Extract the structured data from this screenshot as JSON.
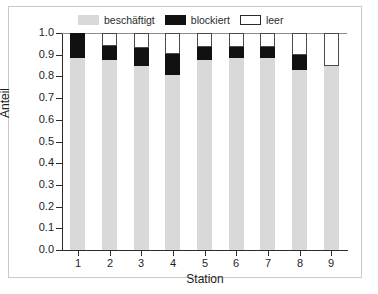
{
  "chart_data": {
    "type": "bar",
    "subtype": "stacked-vertical",
    "title": "",
    "xlabel": "Station",
    "ylabel": "Anteil",
    "categories": [
      "1",
      "2",
      "3",
      "4",
      "5",
      "6",
      "7",
      "8",
      "9"
    ],
    "xtick_labels": [
      "1",
      "2",
      "3",
      "4",
      "5",
      "6",
      "7",
      "8",
      "9"
    ],
    "ytick_labels": [
      "1.0",
      "0.9",
      "0.8",
      "0.7",
      "0.6",
      "0.5",
      "0.4",
      "0.3",
      "0.2",
      "0.1",
      "0.0"
    ],
    "ytick_values": [
      1.0,
      0.9,
      0.8,
      0.7,
      0.6,
      0.5,
      0.4,
      0.3,
      0.2,
      0.1,
      0.0
    ],
    "ylim": [
      0.0,
      1.0
    ],
    "grid": false,
    "legend_position": "top",
    "stacked_total": 1.0,
    "series": [
      {
        "name": "beschäftigt",
        "color": "#d9d9d9",
        "values": [
          0.885,
          0.875,
          0.85,
          0.808,
          0.877,
          0.885,
          0.887,
          0.828,
          0.848
        ]
      },
      {
        "name": "blockiert",
        "color": "#111111",
        "values": [
          0.115,
          0.065,
          0.08,
          0.097,
          0.058,
          0.05,
          0.048,
          0.072,
          0.0
        ]
      },
      {
        "name": "leer",
        "color": "#ffffff",
        "values": [
          0.0,
          0.06,
          0.07,
          0.095,
          0.065,
          0.065,
          0.065,
          0.1,
          0.152
        ]
      }
    ]
  },
  "legend": {
    "items": [
      {
        "label": "beschäftigt",
        "swatch": "busy"
      },
      {
        "label": "blockiert",
        "swatch": "block"
      },
      {
        "label": "leer",
        "swatch": "empty"
      }
    ]
  },
  "axes": {
    "y_title": "Anteil",
    "x_title": "Station"
  },
  "colors": {
    "busy": "#d9d9d9",
    "blocked": "#111111",
    "empty": "#ffffff",
    "axis": "#2b2b2b",
    "frame": "#c9c9c9",
    "text": "#1d1d1d"
  }
}
